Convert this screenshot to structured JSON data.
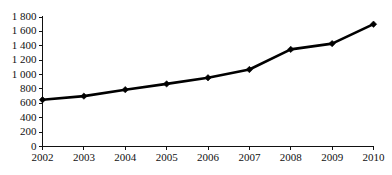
{
  "chart_data": {
    "type": "line",
    "title": "",
    "subtitle": "",
    "xlabel": "",
    "ylabel": "",
    "categories": [
      "2002",
      "2003",
      "2004",
      "2005",
      "2006",
      "2007",
      "2008",
      "2009",
      "2010"
    ],
    "x": [
      2002,
      2003,
      2004,
      2005,
      2006,
      2007,
      2008,
      2009,
      2010
    ],
    "values": [
      650,
      700,
      790,
      870,
      955,
      1070,
      1350,
      1430,
      1700
    ],
    "series": [
      {
        "name": "",
        "values": [
          650,
          700,
          790,
          870,
          955,
          1070,
          1350,
          1430,
          1700
        ]
      }
    ],
    "ylim": [
      0,
      1800
    ],
    "ytick_step": 200,
    "ytick_labels": [
      "0",
      "200",
      "400",
      "600",
      "800",
      "1 000",
      "1 200",
      "1 400",
      "1 600",
      "1 800"
    ],
    "ytick_values": [
      0,
      200,
      400,
      600,
      800,
      1000,
      1200,
      1400,
      1600,
      1800
    ],
    "xtick_labels": [
      "2002",
      "2003",
      "2004",
      "2005",
      "2006",
      "2007",
      "2008",
      "2009",
      "2010"
    ],
    "grid": false,
    "legend": false,
    "legend_position": "none",
    "marker": "diamond",
    "line_color": "#000000",
    "marker_color": "#000000",
    "axis_color": "#111111",
    "background_color": "#ffffff"
  }
}
